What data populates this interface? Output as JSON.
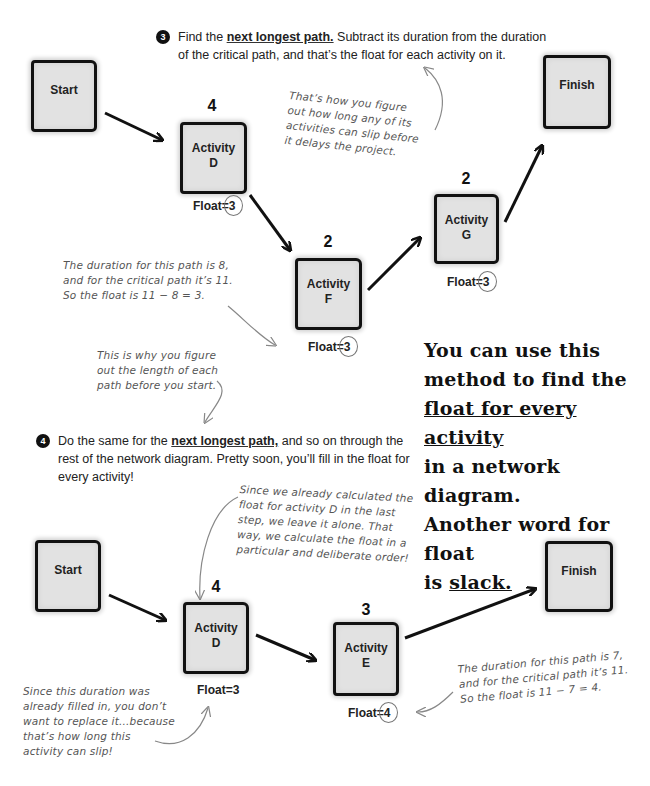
{
  "top_section": {
    "step": {
      "number": "3",
      "prefix": "Find the ",
      "emphasis": "next longest path.",
      "line1_rest": " Subtract its duration from the duration",
      "line2": "of the critical path, and that’s the float for each activity on it."
    },
    "nodes": {
      "start": {
        "label": "Start"
      },
      "activity_d": {
        "label_line1": "Activity",
        "label_line2": "D",
        "duration": "4",
        "float_prefix": "Float=",
        "float_value": "3"
      },
      "activity_f": {
        "label_line1": "Activity",
        "label_line2": "F",
        "duration": "2",
        "float_prefix": "Float=",
        "float_value": "3"
      },
      "activity_g": {
        "label_line1": "Activity",
        "label_line2": "G",
        "duration": "2",
        "float_prefix": "Float=",
        "float_value": "3"
      },
      "finish": {
        "label": "Finish"
      }
    },
    "annotations": {
      "slip_note": [
        "That’s how you figure",
        "out how long any of its",
        "activities can slip before",
        "it delays the project."
      ],
      "duration_note": [
        "The duration for this path is 8,",
        "and for the critical path it’s 11.",
        "So the float is 11 − 8 = 3."
      ],
      "why_note": [
        "This is why you figure",
        "out the length of each",
        "path before you start."
      ]
    }
  },
  "callout": {
    "line1": "You can use this",
    "line2": "method to find the",
    "line3": "float for every activity",
    "line4": "in a network diagram.",
    "line5": "Another word for float",
    "line6_prefix": "is ",
    "line6_emphasis": "slack."
  },
  "bottom_section": {
    "step": {
      "number": "4",
      "prefix": "Do the same for the ",
      "emphasis": "next longest path,",
      "line1_rest": " and so on through the",
      "line2": "rest of the network diagram. Pretty soon, you’ll fill in the float for",
      "line3": "every activity!"
    },
    "nodes": {
      "start": {
        "label": "Start"
      },
      "activity_d": {
        "label_line1": "Activity",
        "label_line2": "D",
        "duration": "4",
        "float_prefix": "Float=",
        "float_value": "3"
      },
      "activity_e": {
        "label_line1": "Activity",
        "label_line2": "E",
        "duration": "3",
        "float_prefix": "Float=",
        "float_value": "4"
      },
      "finish": {
        "label": "Finish"
      }
    },
    "annotations": {
      "already_calc_note": [
        "Since we already calculated the",
        "float for activity D in the last",
        "step, we leave it alone. That",
        "way, we calculate the float in a",
        "particular and deliberate order!"
      ],
      "filled_in_note": [
        "Since this duration was",
        "already filled in, you don’t",
        "want to replace it...because",
        "that’s how long this",
        "activity can slip!"
      ],
      "duration_note": [
        "The duration for this path is 7,",
        "and for the critical path it’s 11.",
        "So the float is 11 − 7 = 4."
      ]
    }
  }
}
